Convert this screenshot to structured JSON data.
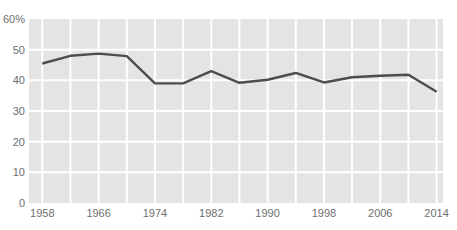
{
  "chart_data": {
    "type": "line",
    "title": "",
    "xlabel": "",
    "ylabel": "",
    "x": [
      1958,
      1962,
      1966,
      1970,
      1974,
      1978,
      1982,
      1986,
      1990,
      1994,
      1998,
      2002,
      2006,
      2010,
      2014
    ],
    "values": [
      45.5,
      48,
      48.7,
      47.9,
      39,
      39,
      43,
      39.2,
      40.2,
      42.4,
      39.3,
      41,
      41.5,
      41.8,
      36.3
    ],
    "xlim": [
      1958,
      2014
    ],
    "ylim": [
      0,
      60
    ],
    "grid": "on",
    "x_gridline_step_years": 4,
    "y_gridline_step": 10,
    "y_ticks": [
      {
        "value": 60,
        "label": "60%"
      },
      {
        "value": 50,
        "label": "50"
      },
      {
        "value": 40,
        "label": "40"
      },
      {
        "value": 30,
        "label": "30"
      },
      {
        "value": 20,
        "label": "20"
      },
      {
        "value": 10,
        "label": "10"
      },
      {
        "value": 0,
        "label": "0"
      }
    ],
    "x_ticks": [
      {
        "value": 1958,
        "label": "1958"
      },
      {
        "value": 1966,
        "label": "1966"
      },
      {
        "value": 1974,
        "label": "1974"
      },
      {
        "value": 1982,
        "label": "1982"
      },
      {
        "value": 1990,
        "label": "1990"
      },
      {
        "value": 1998,
        "label": "1998"
      },
      {
        "value": 2006,
        "label": "2006"
      },
      {
        "value": 2014,
        "label": "2014"
      }
    ],
    "legend": "none",
    "colors": {
      "page_background": "#ffffff",
      "plot_background": "#e4e4e3",
      "gridline": "#ffffff",
      "line": "#4d4d4f",
      "tick_text": "#6e6e6e"
    }
  }
}
